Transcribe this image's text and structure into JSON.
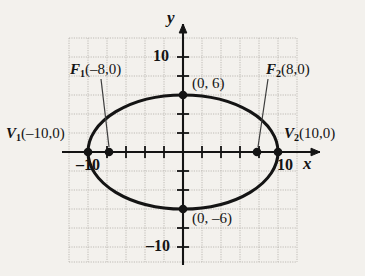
{
  "figure": {
    "kind": "ellipse-graph",
    "colors": {
      "background": "#f3f1ed",
      "grid": "#b9b6b0",
      "axis": "#141414",
      "curve": "#141414",
      "point": "#141414",
      "leader": "#3c3c3c"
    },
    "axes": {
      "x_label": "x",
      "y_label": "y",
      "x_range": [
        -12,
        12
      ],
      "y_range": [
        -12,
        12
      ],
      "tick_interval": 2,
      "grid": true,
      "origin_px": [
        183,
        152
      ],
      "scale_px_per_unit": 9.5
    },
    "ticks": {
      "x_negative": "–10",
      "x_positive": "10",
      "y_positive": "10",
      "y_negative": "–10"
    },
    "curve": {
      "type": "ellipse",
      "center": [
        0,
        0
      ],
      "semi_major_a": 10,
      "semi_minor_b": 6,
      "c_focal": 8,
      "orientation": "horizontal"
    },
    "points": [
      {
        "id": "V1",
        "label_var": "V",
        "label_sub": "1",
        "label_coords": "(–10,0)",
        "x": -10,
        "y": 0,
        "label_text": "V₁(–10,0)"
      },
      {
        "id": "V2",
        "label_var": "V",
        "label_sub": "2",
        "label_coords": "(10,0)",
        "x": 10,
        "y": 0,
        "label_text": "V₂(10,0)"
      },
      {
        "id": "F1",
        "label_var": "F",
        "label_sub": "1",
        "label_coords": "(–8,0)",
        "x": -8,
        "y": 0,
        "label_text": "F₁(–8,0)"
      },
      {
        "id": "F2",
        "label_var": "F",
        "label_sub": "2",
        "label_coords": "(8,0)",
        "x": 8,
        "y": 0,
        "label_text": "F₂(8,0)"
      },
      {
        "id": "CoVertexTop",
        "label_coords": "(0, 6)",
        "x": 0,
        "y": 6,
        "label_text": "(0, 6)"
      },
      {
        "id": "CoVertexBottom",
        "label_coords": "(0, –6)",
        "x": 0,
        "y": -6,
        "label_text": "(0, –6)"
      }
    ]
  }
}
